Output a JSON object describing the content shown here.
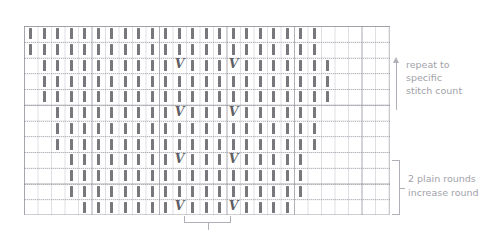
{
  "chart_data": {
    "type": "table",
    "subtitle": "",
    "xlabel": "",
    "ylabel": "",
    "grid": true,
    "legend_position": "right",
    "symbol_legend": [
      {
        "symbol": "|",
        "name": "knit-stitch",
        "meaning": "knit"
      },
      {
        "symbol": "V",
        "name": "increase-stitch",
        "meaning": "increase (make one / kfb)"
      }
    ],
    "geometry": {
      "columns": 27,
      "rows": 12,
      "cell_width": 13.5,
      "cell_height": 15.75,
      "origin_x": 24,
      "origin_y": 26,
      "heavy_line_every": 5
    },
    "rows": [
      {
        "round": 1,
        "start_col": 1,
        "end_col": 22,
        "increase_cols": []
      },
      {
        "round": 2,
        "start_col": 1,
        "end_col": 22,
        "increase_cols": []
      },
      {
        "round": 3,
        "start_col": 2,
        "end_col": 23,
        "increase_cols": [
          12,
          16
        ]
      },
      {
        "round": 4,
        "start_col": 2,
        "end_col": 23,
        "increase_cols": []
      },
      {
        "round": 5,
        "start_col": 2,
        "end_col": 23,
        "increase_cols": []
      },
      {
        "round": 6,
        "start_col": 3,
        "end_col": 22,
        "increase_cols": [
          12,
          16
        ]
      },
      {
        "round": 7,
        "start_col": 3,
        "end_col": 22,
        "increase_cols": []
      },
      {
        "round": 8,
        "start_col": 3,
        "end_col": 22,
        "increase_cols": []
      },
      {
        "round": 9,
        "start_col": 4,
        "end_col": 21,
        "increase_cols": [
          12,
          16
        ]
      },
      {
        "round": 10,
        "start_col": 4,
        "end_col": 21,
        "increase_cols": []
      },
      {
        "round": 11,
        "start_col": 4,
        "end_col": 21,
        "increase_cols": []
      },
      {
        "round": 12,
        "start_col": 5,
        "end_col": 20,
        "increase_cols": [
          12,
          16
        ]
      }
    ],
    "repeat_span": {
      "start_col": 12,
      "end_col": 16
    }
  },
  "annotations": {
    "repeat": {
      "name": "repeat-to-stitch-count",
      "line1": "repeat to",
      "line2": "specific",
      "line3": "stitch count"
    },
    "rounds": {
      "name": "round-sequence",
      "line1": "2 plain rounds",
      "line2": "increase round"
    }
  },
  "colors": {
    "stitch": "#77777c",
    "increase": "#5f5f66",
    "grid_light": "#afafb9",
    "grid_heavy": "#8c8c96",
    "annotation": "#a2a2aa",
    "background": "#ffffff"
  }
}
